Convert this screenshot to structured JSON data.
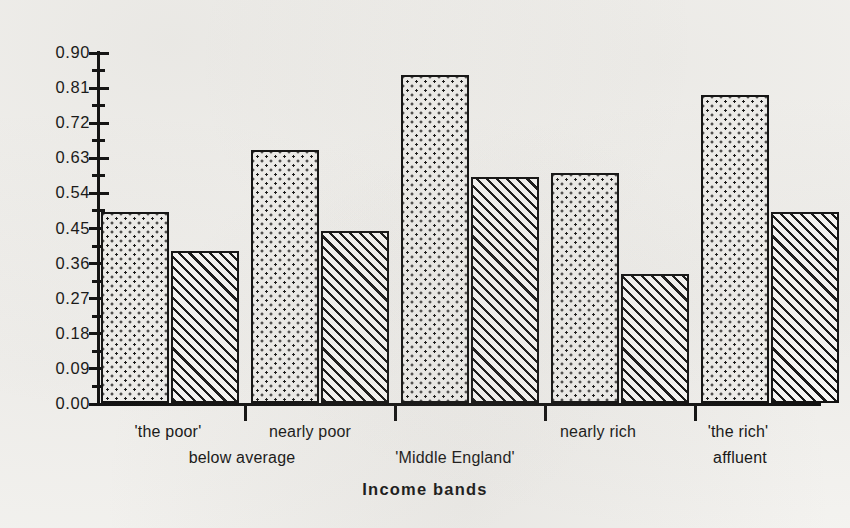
{
  "chart_data": {
    "type": "bar",
    "title": "",
    "xlabel": "Income bands",
    "ylabel": "",
    "ylim": [
      0.0,
      0.9
    ],
    "ytick_labels": [
      "0.90",
      "0.81",
      "0.72",
      "0.63",
      "0.54",
      "0.45",
      "0.36",
      "0.27",
      "0.18",
      "0.09",
      "0.00"
    ],
    "ytick_values": [
      0.9,
      0.81,
      0.72,
      0.63,
      0.54,
      0.45,
      0.36,
      0.27,
      0.18,
      0.09,
      0.0
    ],
    "ytick_step": 0.09,
    "minor_ticks": true,
    "grid": false,
    "legend": "none",
    "categories": [
      "'the poor'",
      "nearly poor",
      "'Middle England'",
      "nearly rich",
      "'the rich'"
    ],
    "group_labels_row2": [
      "below average",
      "",
      "",
      "affluent",
      ""
    ],
    "series": [
      {
        "name": "series-1",
        "pattern": "dotted",
        "values": [
          0.49,
          0.65,
          0.84,
          0.59,
          0.79
        ]
      },
      {
        "name": "series-2",
        "pattern": "hatched",
        "values": [
          0.39,
          0.44,
          0.58,
          0.33,
          0.49
        ]
      }
    ],
    "bars": [
      {
        "group": "'the poor'",
        "series": "series-1",
        "value": 0.49,
        "pattern": "dotted"
      },
      {
        "group": "'the poor'",
        "series": "series-2",
        "value": 0.39,
        "pattern": "hatched"
      },
      {
        "group": "nearly poor",
        "series": "series-1",
        "value": 0.65,
        "pattern": "dotted"
      },
      {
        "group": "nearly poor",
        "series": "series-2",
        "value": 0.44,
        "pattern": "hatched"
      },
      {
        "group": "'Middle England'",
        "series": "series-1",
        "value": 0.84,
        "pattern": "dotted"
      },
      {
        "group": "'Middle England'",
        "series": "series-2",
        "value": 0.58,
        "pattern": "hatched"
      },
      {
        "group": "nearly rich",
        "series": "series-1",
        "value": 0.59,
        "pattern": "dotted"
      },
      {
        "group": "nearly rich",
        "series": "series-2",
        "value": 0.33,
        "pattern": "hatched"
      },
      {
        "group": "'the rich'",
        "series": "series-1",
        "value": 0.79,
        "pattern": "dotted"
      },
      {
        "group": "'the rich'",
        "series": "series-2",
        "value": 0.49,
        "pattern": "hatched"
      }
    ],
    "colors": {
      "ink": "#0b0b0b",
      "page": "#f4f3f0",
      "bar_fill": "#f3f2ef"
    }
  },
  "axis": {
    "x_title": "Income bands",
    "y_labels": [
      "0.90",
      "0.81",
      "0.72",
      "0.63",
      "0.54",
      "0.45",
      "0.36",
      "0.27",
      "0.18",
      "0.09",
      "0.00"
    ]
  },
  "x_labels": {
    "row1": [
      {
        "text": "'the poor'",
        "center": 168
      },
      {
        "text": "nearly poor",
        "center": 310
      },
      {
        "text": "nearly rich",
        "center": 598
      },
      {
        "text": "'the rich'",
        "center": 738
      }
    ],
    "row2": [
      {
        "text": "below average",
        "center": 242
      },
      {
        "text": "'Middle England'",
        "center": 455
      },
      {
        "text": "affluent",
        "center": 740
      }
    ]
  }
}
